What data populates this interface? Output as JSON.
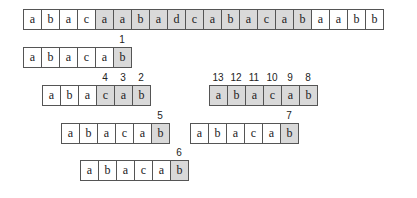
{
  "text_row": {
    "chars": [
      "a",
      "b",
      "a",
      "c",
      "a",
      "a",
      "b",
      "a",
      "d",
      "c",
      "a",
      "b",
      "a",
      "c",
      "a",
      "b",
      "a",
      "a",
      "b",
      "b"
    ],
    "shaded": [
      false,
      false,
      false,
      false,
      true,
      true,
      true,
      true,
      true,
      true,
      true,
      true,
      true,
      true,
      true,
      true,
      false,
      false,
      false,
      false
    ]
  },
  "patterns": [
    {
      "id": "p1",
      "chars": [
        "a",
        "b",
        "a",
        "c",
        "a",
        "b"
      ],
      "shaded": [
        false,
        false,
        false,
        false,
        false,
        true
      ],
      "labels": [
        "",
        "",
        "",
        "",
        "",
        "1"
      ]
    },
    {
      "id": "p2",
      "chars": [
        "a",
        "b",
        "a",
        "c",
        "a",
        "b"
      ],
      "shaded": [
        false,
        false,
        false,
        true,
        true,
        true
      ],
      "labels": [
        "",
        "",
        "",
        "4",
        "3",
        "2"
      ]
    },
    {
      "id": "p3",
      "chars": [
        "a",
        "b",
        "a",
        "c",
        "a",
        "b"
      ],
      "shaded": [
        true,
        true,
        true,
        true,
        true,
        true
      ],
      "labels": [
        "13",
        "12",
        "11",
        "10",
        "9",
        "8"
      ]
    },
    {
      "id": "p4",
      "chars": [
        "a",
        "b",
        "a",
        "c",
        "a",
        "b"
      ],
      "shaded": [
        false,
        false,
        false,
        false,
        false,
        true
      ],
      "labels": [
        "",
        "",
        "",
        "",
        "",
        "5"
      ]
    },
    {
      "id": "p5",
      "chars": [
        "a",
        "b",
        "a",
        "c",
        "a",
        "b"
      ],
      "shaded": [
        false,
        false,
        false,
        false,
        false,
        true
      ],
      "labels": [
        "",
        "",
        "",
        "",
        "",
        "7"
      ]
    },
    {
      "id": "p6",
      "chars": [
        "a",
        "b",
        "a",
        "c",
        "a",
        "b"
      ],
      "shaded": [
        false,
        false,
        false,
        false,
        false,
        true
      ],
      "labels": [
        "",
        "",
        "",
        "",
        "",
        "6"
      ]
    }
  ]
}
